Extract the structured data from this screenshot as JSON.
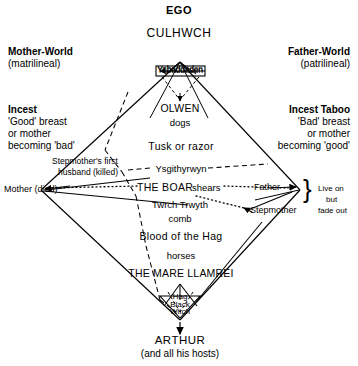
{
  "headings": {
    "ego": "EGO",
    "culhwch": "CULHWCH",
    "arthur": "ARTHUR",
    "arthur_sub": "(and all his hosts)"
  },
  "corners": {
    "mother_world": "Mother-World",
    "mother_world_sub": "(matrilineal)",
    "father_world": "Father-World",
    "father_world_sub": "(patrilineal)",
    "incest": "Incest",
    "incest_lines": [
      "'Good' breast",
      "or  mother",
      "becoming 'bad'"
    ],
    "incest_taboo": "Incest Taboo",
    "incest_taboo_lines": [
      "'Bad' breast",
      "or  mother",
      "becoming 'good'"
    ],
    "live_on_lines": [
      "Live  on",
      "but",
      "fade out"
    ]
  },
  "axis": {
    "left_vertex": "Mother (died)",
    "right_vertex": "Father",
    "stepmother": "Stepmother",
    "stepmother_first_husband_l1": "Stepmother's  first",
    "stepmother_first_husband_l2": "husband (killed)"
  },
  "center_chain": [
    {
      "name": "ysbaddaden",
      "label": "Ysbaddaden",
      "overlay": "Ysbaddaden"
    },
    {
      "name": "olwen",
      "label": "OLWEN"
    },
    {
      "name": "dogs",
      "label": "dogs"
    },
    {
      "name": "tusk-or-razor",
      "label": "Tusk or razor"
    },
    {
      "name": "ysgithyrwyn",
      "label": "Ysgithyrwyn"
    },
    {
      "name": "the-boar",
      "label": "THE BOAR"
    },
    {
      "name": "shears",
      "label": "shears"
    },
    {
      "name": "twrch-trwyth",
      "label": "Twrch Trwyth"
    },
    {
      "name": "comb",
      "label": "comb"
    },
    {
      "name": "blood-of-the-hag",
      "label": "Blood of the Hag"
    },
    {
      "name": "horses",
      "label": "horses"
    },
    {
      "name": "the-mare-llamrei",
      "label": "THE MARE LLAMREI"
    }
  ],
  "bottom_cluster": [
    "Hag",
    "Black",
    "Witch"
  ],
  "colors": {
    "ink": "#000000",
    "paper": "#ffffff"
  }
}
